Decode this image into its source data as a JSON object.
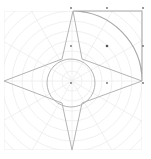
{
  "canvas": {
    "width": 151,
    "height": 159,
    "background": "#ffffff"
  },
  "colors": {
    "grid": "#ececec",
    "shape_stroke": "#b4b4b4",
    "arc_stroke": "#a8a8a8",
    "handle": "#6a6a6a"
  },
  "polar_grid": {
    "center": [
      72,
      81
    ],
    "clip_box": {
      "x": 4,
      "y": 11,
      "width": 138,
      "height": 139
    },
    "ring_spacing": 10,
    "ring_count": 10,
    "spoke_angles_deg": [
      0,
      30,
      60,
      90,
      120,
      150,
      180,
      210,
      240,
      270,
      300,
      330
    ]
  },
  "star": {
    "points": [
      [
        73,
        11
      ],
      [
        82,
        59
      ],
      [
        142,
        81
      ],
      [
        82,
        103
      ],
      [
        72,
        150
      ],
      [
        62,
        103
      ],
      [
        4,
        81
      ],
      [
        62,
        59
      ]
    ]
  },
  "inner_circle": {
    "cx": 71,
    "cy": 83,
    "r": 24
  },
  "quarter_sector": {
    "center": [
      72,
      81
    ],
    "start": [
      73,
      11
    ],
    "end": [
      142,
      81
    ],
    "corner": [
      142,
      11
    ]
  },
  "handles": [
    {
      "x": 71,
      "y": 8
    },
    {
      "x": 107,
      "y": 8
    },
    {
      "x": 143,
      "y": 8
    },
    {
      "x": 71,
      "y": 46
    },
    {
      "x": 107,
      "y": 46,
      "main": true
    },
    {
      "x": 143,
      "y": 46
    },
    {
      "x": 71,
      "y": 83
    },
    {
      "x": 107,
      "y": 83
    },
    {
      "x": 143,
      "y": 83
    }
  ]
}
